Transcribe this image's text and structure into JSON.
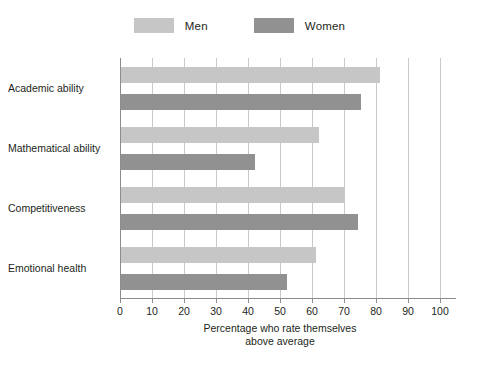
{
  "chart_data": {
    "type": "bar",
    "orientation": "horizontal",
    "title": "",
    "subtitle": "",
    "xlabel_line1": "Percentage who rate themselves",
    "xlabel_line2": "above average",
    "ylabel": "",
    "categories": [
      "Academic ability",
      "Mathematical ability",
      "Competitiveness",
      "Emotional health"
    ],
    "series": [
      {
        "name": "Men",
        "color": "#c6c6c6",
        "values": [
          81,
          62,
          70,
          61
        ]
      },
      {
        "name": "Women",
        "color": "#919191",
        "values": [
          75,
          42,
          74,
          52
        ]
      }
    ],
    "xlim": [
      0,
      100
    ],
    "xticks": [
      0,
      10,
      20,
      30,
      40,
      50,
      60,
      70,
      80,
      90,
      100
    ],
    "xtick_labels": [
      "0",
      "10",
      "20",
      "30",
      "40",
      "50",
      "60",
      "70",
      "80",
      "90",
      "100"
    ],
    "grid": "vertical",
    "legend_position": "top-center"
  },
  "legend": {
    "entries": [
      {
        "label": "Men",
        "swatch_name": "legend-swatch-men",
        "color": "#c6c6c6"
      },
      {
        "label": "Women",
        "swatch_name": "legend-swatch-women",
        "color": "#919191"
      }
    ]
  },
  "axis": {
    "line_color": "#8c8c8c",
    "grid_color": "#c9c9c9"
  }
}
